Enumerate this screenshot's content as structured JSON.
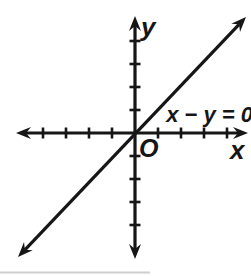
{
  "figure": {
    "type": "coordinate-plane-graph",
    "background_color": "#ffffff",
    "ink_color": "#161616",
    "artifact_color": "#cfcfcf",
    "labels": {
      "y_axis": "y",
      "x_axis": "x",
      "origin": "O",
      "equation": "x − y = 0"
    },
    "graph": {
      "line": {
        "equation_label": "x − y = 0",
        "slope": 1,
        "y_intercept": 0,
        "passes_through_origin": true,
        "arrows_both_ends": true
      },
      "x_axis": {
        "ticks_each_side": 4,
        "arrows_both_ends": true
      },
      "y_axis": {
        "ticks_each_side": 4,
        "arrows_both_ends": true
      }
    }
  }
}
